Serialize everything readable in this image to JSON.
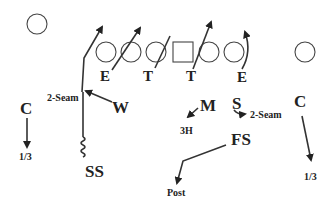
{
  "diagram": {
    "type": "football-play-diagram",
    "offense": {
      "players": [
        {
          "shape": "circle",
          "role": "wide-receiver-left",
          "x": 37,
          "y": 24
        },
        {
          "shape": "circle",
          "role": "lineman",
          "x": 106,
          "y": 52
        },
        {
          "shape": "circle",
          "role": "lineman",
          "x": 131,
          "y": 52
        },
        {
          "shape": "circle",
          "role": "lineman",
          "x": 156,
          "y": 52
        },
        {
          "shape": "square",
          "role": "center",
          "x": 183,
          "y": 52
        },
        {
          "shape": "circle",
          "role": "lineman",
          "x": 209,
          "y": 52
        },
        {
          "shape": "circle",
          "role": "lineman",
          "x": 234,
          "y": 52
        },
        {
          "shape": "circle",
          "role": "wide-receiver-right",
          "x": 305,
          "y": 52
        }
      ]
    },
    "defense": {
      "line_labels": [
        "E",
        "T",
        "T",
        "E"
      ],
      "labels": {
        "corner_left": "C",
        "will": "W",
        "mike": "M",
        "sam": "S",
        "corner_right": "C",
        "strong_safety": "SS",
        "free_safety": "FS"
      },
      "assignments": {
        "corner_left": "1/3",
        "will": "2-Seam",
        "mike": "3H",
        "sam": "2-Seam",
        "corner_right": "1/3",
        "free_safety": "Post"
      }
    }
  }
}
